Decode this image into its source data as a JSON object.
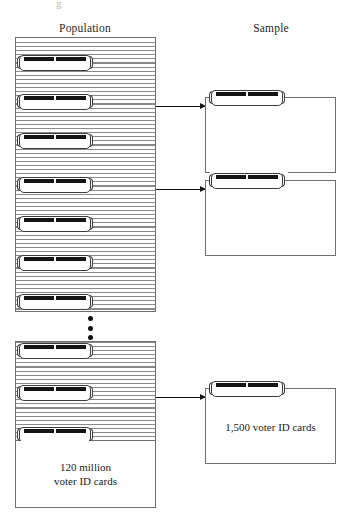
{
  "figure": {
    "columns": {
      "population_label": "Population",
      "sample_label": "Sample"
    },
    "population": {
      "caption_line_1": "120 million",
      "caption_line_2": "voter ID cards",
      "ellipsis": "⋮",
      "card_icon_name": "voter-id-card-icon",
      "top_stack_card_count": 7,
      "bottom_stack_card_count": 3
    },
    "sample": {
      "boxes": [
        {
          "caption": ""
        },
        {
          "caption": ""
        },
        {
          "caption": "1,500 voter ID cards"
        }
      ]
    },
    "arrows": [
      {
        "label": ""
      },
      {
        "label": ""
      },
      {
        "label": ""
      }
    ],
    "colors": {
      "ink": "#1b1b1b",
      "rule": "#6f6f6f",
      "stripe": "#8a8a8a",
      "card_stripe": "#141414",
      "paper": "#ffffff"
    },
    "artifact_glyph": "g"
  }
}
